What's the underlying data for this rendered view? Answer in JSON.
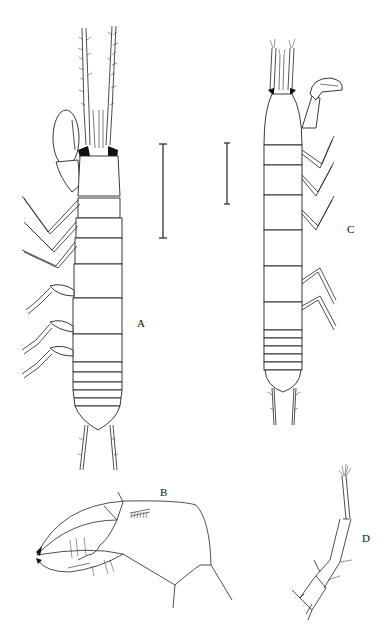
{
  "figure": {
    "panels": [
      {
        "id": "A",
        "label": "A",
        "description": "Habitus, dorsal view"
      },
      {
        "id": "B",
        "label": "B",
        "description": "Cheliped chela, detail"
      },
      {
        "id": "C",
        "label": "C",
        "description": "Habitus, dorsal view"
      },
      {
        "id": "D",
        "label": "D",
        "description": "Uropod"
      }
    ],
    "scale_bars": [
      {
        "panel": "A",
        "orientation": "vertical"
      },
      {
        "panel": "C",
        "orientation": "vertical"
      }
    ],
    "colors": {
      "ink": "#222222",
      "background": "#ffffff"
    }
  }
}
